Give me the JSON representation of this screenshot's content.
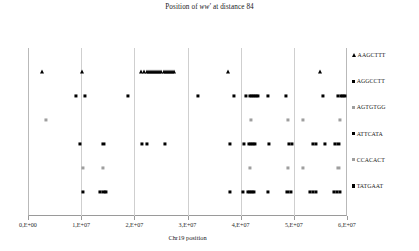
{
  "chart": {
    "title_prefix": "Position of ",
    "title_italic": "ww'",
    "title_suffix": " at distance 84",
    "title_full": "Position of ww' at distance 84"
  },
  "chart_data": {
    "type": "scatter",
    "title": "Position of ww' at distance 84",
    "xlabel": "Chr19 position",
    "ylabel": "",
    "xlim": [
      0,
      60000000
    ],
    "ylim": [
      0,
      7
    ],
    "grid": "vertical-only",
    "legend_position": "right",
    "xticks": [
      0,
      10000000,
      20000000,
      30000000,
      40000000,
      50000000,
      60000000
    ],
    "xtick_labels": [
      "0,E+00",
      "1,E+07",
      "2,E+07",
      "3,E+07",
      "4,E+07",
      "5,E+07",
      "6,E+07"
    ],
    "series": [
      {
        "name": "AAGCTTT",
        "marker": "triangle",
        "color": "#000000",
        "row": 6,
        "x": [
          2600000,
          10200000,
          21300000,
          21900000,
          22300000,
          22700000,
          23100000,
          23500000,
          23900000,
          24300000,
          24700000,
          25100000,
          25500000,
          25900000,
          26300000,
          26700000,
          27100000,
          27500000,
          37700000,
          55000000
        ]
      },
      {
        "name": "AGGCCTT",
        "marker": "square",
        "color": "#000000",
        "row": 5,
        "x": [
          9000000,
          10700000,
          18800000,
          31900000,
          38700000,
          41000000,
          41700000,
          42100000,
          42500000,
          42900000,
          43300000,
          45200000,
          48500000,
          55400000,
          58300000,
          58800000,
          59200000,
          59600000
        ]
      },
      {
        "name": "AGTGTGG",
        "marker": "square",
        "color": "#9e9e9e",
        "row": 4,
        "x": [
          3400000,
          41900000,
          48900000,
          51800000,
          58700000
        ]
      },
      {
        "name": "ATTCATA",
        "marker": "square",
        "color": "#000000",
        "row": 3,
        "x": [
          9800000,
          14200000,
          21500000,
          22300000,
          25700000,
          37900000,
          40600000,
          41500000,
          41900000,
          42300000,
          42700000,
          45300000,
          49100000,
          49700000,
          53600000,
          54200000,
          55900000,
          57800000,
          58400000
        ]
      },
      {
        "name": "CCACACT",
        "marker": "square",
        "color": "#9e9e9e",
        "row": 2,
        "x": [
          10400000,
          14100000,
          41700000,
          48900000,
          51700000,
          58400000
        ]
      },
      {
        "name": "TATGAAT",
        "marker": "square",
        "color": "#000000",
        "row": 1,
        "x": [
          10300000,
          13600000,
          14200000,
          14700000,
          37900000,
          40500000,
          41300000,
          41700000,
          42100000,
          42500000,
          45200000,
          48800000,
          49400000,
          53000000,
          53600000,
          54100000,
          57600000,
          58100000,
          58700000
        ]
      }
    ]
  },
  "legend": {
    "items": [
      {
        "label": "AAGCTTT",
        "marker": "triangle",
        "color": "#000000"
      },
      {
        "label": "AGGCCTT",
        "marker": "square",
        "color": "#000000"
      },
      {
        "label": "AGTGTGG",
        "marker": "square",
        "color": "#9e9e9e"
      },
      {
        "label": "ATTCATA",
        "marker": "square",
        "color": "#000000"
      },
      {
        "label": "CCACACT",
        "marker": "square",
        "color": "#9e9e9e"
      },
      {
        "label": "TATGAAT",
        "marker": "square",
        "color": "#000000"
      }
    ]
  }
}
